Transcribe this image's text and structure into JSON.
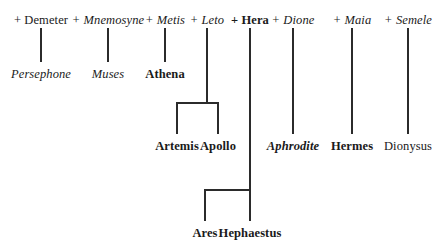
{
  "diagram": {
    "line_color": "#2b2b2b",
    "background": "#ffffff"
  },
  "consorts": [
    {
      "label": "+ Demeter",
      "style": "roman"
    },
    {
      "label": "+ Mnemosyne",
      "style": "italic"
    },
    {
      "label": "+ Metis",
      "style": "italic"
    },
    {
      "label": "+ Leto",
      "style": "italic"
    },
    {
      "label": "+ Hera",
      "style": "bold"
    },
    {
      "label": "+ Dione",
      "style": "italic"
    },
    {
      "label": "+ Maia",
      "style": "italic"
    },
    {
      "label": "+ Semele",
      "style": "italic"
    }
  ],
  "children": {
    "row2": [
      {
        "label": "Persephone",
        "style": "italic-reg"
      },
      {
        "label": "Muses",
        "style": "italic-reg"
      },
      {
        "label": "Athena",
        "style": "bold"
      }
    ],
    "row3": [
      {
        "label": "Artemis",
        "style": "bold"
      },
      {
        "label": "Apollo",
        "style": "bold"
      },
      {
        "label": "Aphrodite",
        "style": "bold-italic"
      },
      {
        "label": "Hermes",
        "style": "bold"
      },
      {
        "label": "Dionysus",
        "style": "roman-reg"
      }
    ],
    "row4": [
      {
        "label": "Ares",
        "style": "bold"
      },
      {
        "label": "Hephaestus",
        "style": "bold"
      }
    ]
  }
}
